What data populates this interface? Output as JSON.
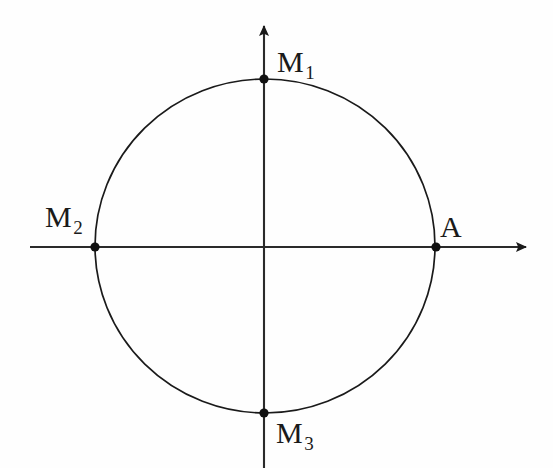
{
  "figure": {
    "background_color": "#fefefe",
    "stroke_color": "#1a1a1a",
    "width": 553,
    "height": 468
  },
  "axes": {
    "x_axis": {
      "name": "horizontal-axis",
      "y": 247,
      "x_start": 30,
      "x_end": 532,
      "arrow_at": "right"
    },
    "y_axis": {
      "name": "vertical-axis",
      "x": 264,
      "y_start": 20,
      "y_end": 468,
      "arrow_at": "top"
    }
  },
  "circle": {
    "center_x": 265,
    "center_y": 246,
    "radius_x": 170,
    "radius_y": 167
  },
  "points": [
    {
      "id": "M1",
      "label": "M",
      "subscript": "1",
      "x": 264,
      "y": 79,
      "label_position": "top-right"
    },
    {
      "id": "M2",
      "label": "M",
      "subscript": "2",
      "x": 95,
      "y": 247,
      "label_position": "left-above"
    },
    {
      "id": "M3",
      "label": "M",
      "subscript": "3",
      "x": 264,
      "y": 413,
      "label_position": "bottom-right"
    },
    {
      "id": "A",
      "label": "A",
      "subscript": "",
      "x": 436,
      "y": 247,
      "label_position": "right-above"
    }
  ],
  "labels": {
    "m1": "M",
    "m1_sub": "1",
    "m2": "M",
    "m2_sub": "2",
    "m3": "M",
    "m3_sub": "3",
    "a": "A"
  }
}
